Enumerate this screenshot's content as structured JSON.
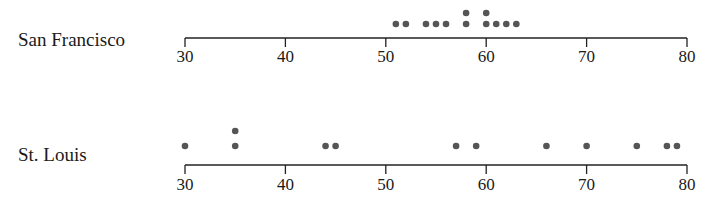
{
  "chart_data": {
    "type": "scatter",
    "subtype": "dot_plot",
    "title": "",
    "xlabel": "",
    "ylabel": "",
    "xlim": [
      30,
      80
    ],
    "ticks": [
      30,
      40,
      50,
      60,
      70,
      80
    ],
    "tick_labels": [
      "30",
      "40",
      "50",
      "60",
      "70",
      "80"
    ],
    "grid": false,
    "legend": null,
    "series": [
      {
        "name": "San Francisco",
        "values": [
          51,
          52,
          54,
          55,
          56,
          58,
          58,
          60,
          60,
          61,
          62,
          63
        ]
      },
      {
        "name": "St. Louis",
        "values": [
          30,
          35,
          35,
          44,
          45,
          57,
          59,
          66,
          70,
          75,
          78,
          79
        ]
      }
    ],
    "dot_color": "#555555"
  }
}
